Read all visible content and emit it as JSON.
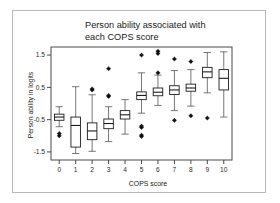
{
  "figure": {
    "title_line1": "Person ability associated with",
    "title_line2": "each COPS score",
    "background": "#ffffff",
    "border_color": "#b9b9b9"
  },
  "chart_data": {
    "type": "boxplot",
    "title": "Person ability associated with each COPS score",
    "xlabel": "COPS score",
    "ylabel": "Person ability in logits",
    "categories": [
      "0",
      "1",
      "2",
      "3",
      "4",
      "5",
      "6",
      "7",
      "8",
      "9",
      "10"
    ],
    "ylim": [
      -1.75,
      1.75
    ],
    "yticks": [
      -1.5,
      -0.5,
      0.5,
      1.5
    ],
    "ytick_labels": [
      "-1.5",
      "-0.5",
      "0.5",
      "1.5"
    ],
    "grid": false,
    "legend": null,
    "boxes": [
      {
        "category": "0",
        "whisker_low": -0.72,
        "q1": -0.52,
        "median": -0.42,
        "q3": -0.33,
        "whisker_high": -0.1,
        "outliers": [
          -0.93,
          -1.0
        ]
      },
      {
        "category": "1",
        "whisker_low": -1.55,
        "q1": -1.35,
        "median": -0.68,
        "q3": -0.42,
        "whisker_high": 0.52,
        "outliers": []
      },
      {
        "category": "2",
        "whisker_low": -1.48,
        "q1": -1.12,
        "median": -0.85,
        "q3": -0.6,
        "whisker_high": 0.27,
        "outliers": [
          0.42,
          0.45
        ]
      },
      {
        "category": "3",
        "whisker_low": -1.18,
        "q1": -0.78,
        "median": -0.62,
        "q3": -0.48,
        "whisker_high": -0.1,
        "outliers": [
          1.08,
          0.22,
          0.25
        ]
      },
      {
        "category": "4",
        "whisker_low": -0.95,
        "q1": -0.48,
        "median": -0.35,
        "q3": -0.22,
        "whisker_high": 0.12,
        "outliers": []
      },
      {
        "category": "5",
        "whisker_low": -0.3,
        "q1": 0.12,
        "median": 0.25,
        "q3": 0.36,
        "whisker_high": 0.95,
        "outliers": [
          1.5,
          -0.7,
          -0.74,
          -0.98,
          -1.02
        ]
      },
      {
        "category": "6",
        "whisker_low": -0.06,
        "q1": 0.24,
        "median": 0.35,
        "q3": 0.48,
        "whisker_high": 0.88,
        "outliers": [
          1.62,
          1.55,
          0.95
        ]
      },
      {
        "category": "7",
        "whisker_low": -0.22,
        "q1": 0.28,
        "median": 0.42,
        "q3": 0.55,
        "whisker_high": 1.02,
        "outliers": [
          1.38,
          -0.52
        ]
      },
      {
        "category": "8",
        "whisker_low": -0.08,
        "q1": 0.38,
        "median": 0.48,
        "q3": 0.6,
        "whisker_high": 1.05,
        "outliers": [
          1.3,
          -0.38
        ]
      },
      {
        "category": "9",
        "whisker_low": 0.33,
        "q1": 0.8,
        "median": 0.98,
        "q3": 1.12,
        "whisker_high": 1.58,
        "outliers": [
          -0.45
        ]
      },
      {
        "category": "10",
        "whisker_low": -0.42,
        "q1": 0.42,
        "median": 0.78,
        "q3": 1.05,
        "whisker_high": 1.6,
        "outliers": []
      }
    ]
  }
}
